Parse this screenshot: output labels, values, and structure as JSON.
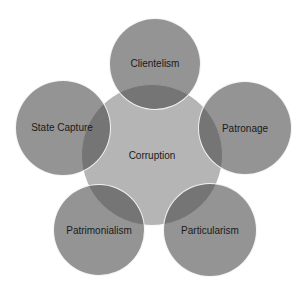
{
  "diagram": {
    "type": "radial-venn",
    "center": {
      "label": "Corruption",
      "cx": 152,
      "cy": 155,
      "r": 71,
      "color": "#b5b5b5"
    },
    "outer": [
      {
        "label": "Clientelism",
        "cx": 155,
        "cy": 64,
        "r": 46
      },
      {
        "label": "Patronage",
        "cx": 245,
        "cy": 128,
        "r": 47
      },
      {
        "label": "Particularism",
        "cx": 210,
        "cy": 230,
        "r": 47
      },
      {
        "label": "Patrimonialism",
        "cx": 99,
        "cy": 230,
        "r": 46
      },
      {
        "label": "State Capture",
        "cx": 63,
        "cy": 128,
        "r": 48
      }
    ],
    "outer_color": "#8c8c8c",
    "overlap_color": "#6e6e6e"
  }
}
